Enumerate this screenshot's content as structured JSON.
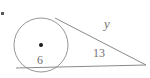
{
  "figure": {
    "background_color": "#ffffff",
    "stroke_color": "#8a8a8a",
    "label_color": "#6f6f6f",
    "center_dot_color": "#1a1a1a",
    "width": 150,
    "height": 78
  },
  "circle": {
    "name": "circle",
    "center_x": 41,
    "center_y": 45,
    "radius": 27,
    "center_dot_radius": 2
  },
  "vertex": {
    "name": "external-point",
    "x": 146,
    "y": 65
  },
  "lines": {
    "upper_tangent": {
      "x1": 55,
      "y1": 18,
      "x2": 146,
      "y2": 65
    },
    "lower_line": {
      "x1": 16,
      "y1": 68,
      "x2": 146,
      "y2": 65
    }
  },
  "labels": {
    "y": "y",
    "thirteen": "13",
    "six": "6"
  },
  "stray_mark": {
    "x": 1,
    "y": 12,
    "size": 3
  }
}
